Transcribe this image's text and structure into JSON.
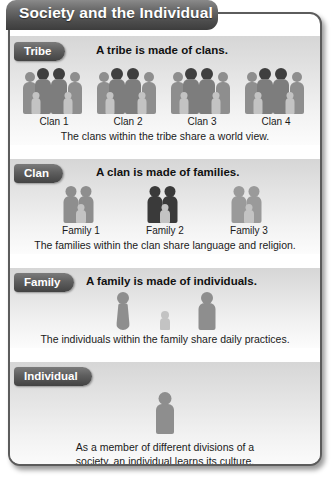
{
  "header": {
    "title": "Society and the Individual"
  },
  "colors": {
    "header_dark": "#4c4c4c",
    "pill_dark": "#4a4a4a",
    "figure_mid": "#8e8e8e",
    "figure_dark": "#3a3a3a",
    "figure_light": "#c3c3c3",
    "panel_bg": "#e4e4e4",
    "frame_border": "#5c5c5c"
  },
  "sections": [
    {
      "label": "Tribe",
      "heading": "A tribe is made of clans.",
      "caption": "The clans within the tribe share a world view.",
      "groups": [
        {
          "label": "Clan 1",
          "figures": [
            "mid-adult",
            "dark-adult",
            "dark-adult",
            "mid-adult",
            "light-child",
            "light-child"
          ]
        },
        {
          "label": "Clan 2",
          "figures": [
            "mid-adult",
            "dark-adult",
            "dark-adult",
            "mid-adult",
            "light-child",
            "light-child"
          ]
        },
        {
          "label": "Clan 3",
          "figures": [
            "mid-adult",
            "dark-adult",
            "dark-adult",
            "mid-adult",
            "light-child",
            "light-child"
          ]
        },
        {
          "label": "Clan 4",
          "figures": [
            "mid-adult",
            "dark-adult",
            "dark-adult",
            "mid-adult",
            "light-child",
            "light-child"
          ]
        }
      ]
    },
    {
      "label": "Clan",
      "heading": "A clan is made of families.",
      "caption": "The families within the clan share language and religion.",
      "groups": [
        {
          "label": "Family 1",
          "figures": [
            "mid-adult",
            "mid-adult",
            "light-child"
          ]
        },
        {
          "label": "Family 2",
          "figures": [
            "dark-adult",
            "dark-adult",
            "light-child"
          ]
        },
        {
          "label": "Family 3",
          "figures": [
            "mid-adult",
            "mid-adult",
            "light-child"
          ]
        }
      ]
    },
    {
      "label": "Family",
      "heading": "A family is made of individuals.",
      "caption": "The individuals within the family share daily practices.",
      "groups": [
        {
          "label": "",
          "figures": [
            "mid-woman"
          ]
        },
        {
          "label": "",
          "figures": [
            "light-child"
          ]
        },
        {
          "label": "",
          "figures": [
            "mid-adult"
          ]
        }
      ]
    },
    {
      "label": "Individual",
      "heading": "",
      "caption": "As a member of different divisions of a\nsociety, an individual learns its culture.",
      "groups": [
        {
          "label": "",
          "figures": [
            "mid-adult"
          ]
        }
      ]
    }
  ]
}
